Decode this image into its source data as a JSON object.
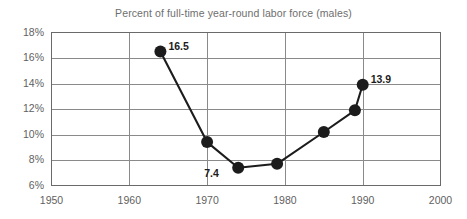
{
  "chart_data": {
    "type": "line",
    "title": "Percent of full-time year-round labor force (males)",
    "xlabel": "",
    "ylabel": "",
    "xlim": [
      1950,
      2000
    ],
    "ylim": [
      6,
      18
    ],
    "grid": true,
    "legend": "none",
    "x_ticks": [
      "1950",
      "1960",
      "1970",
      "1980",
      "1990",
      "2000"
    ],
    "x_tick_values": [
      1950,
      1960,
      1970,
      1980,
      1990,
      2000
    ],
    "y_ticks": [
      "6%",
      "8%",
      "10%",
      "12%",
      "14%",
      "16%",
      "18%"
    ],
    "y_tick_values": [
      6,
      8,
      10,
      12,
      14,
      16,
      18
    ],
    "series": [
      {
        "name": "Percent of full-time year-round labor force (males)",
        "marker": "filled-circle",
        "color": "#1c1c1c",
        "x": [
          1964,
          1970,
          1974,
          1979,
          1985,
          1989,
          1990
        ],
        "y": [
          16.5,
          9.4,
          7.4,
          7.7,
          10.2,
          11.9,
          13.9
        ]
      }
    ],
    "annotations": [
      {
        "text": "16.5",
        "x": 1964,
        "y": 16.5,
        "position": "right"
      },
      {
        "text": "7.4",
        "x": 1974,
        "y": 7.4,
        "position": "left"
      },
      {
        "text": "13.9",
        "x": 1990,
        "y": 13.9,
        "position": "right"
      }
    ]
  },
  "colors": {
    "line": "#1c1c1c",
    "marker": "#1c1c1c",
    "grid": "#8a8a8a",
    "axis": "#6a6a6a",
    "title_text": "#6e6e6e",
    "tick_text": "#5f5f5f",
    "label_text": "#1c1c1c",
    "background": "#ffffff"
  }
}
